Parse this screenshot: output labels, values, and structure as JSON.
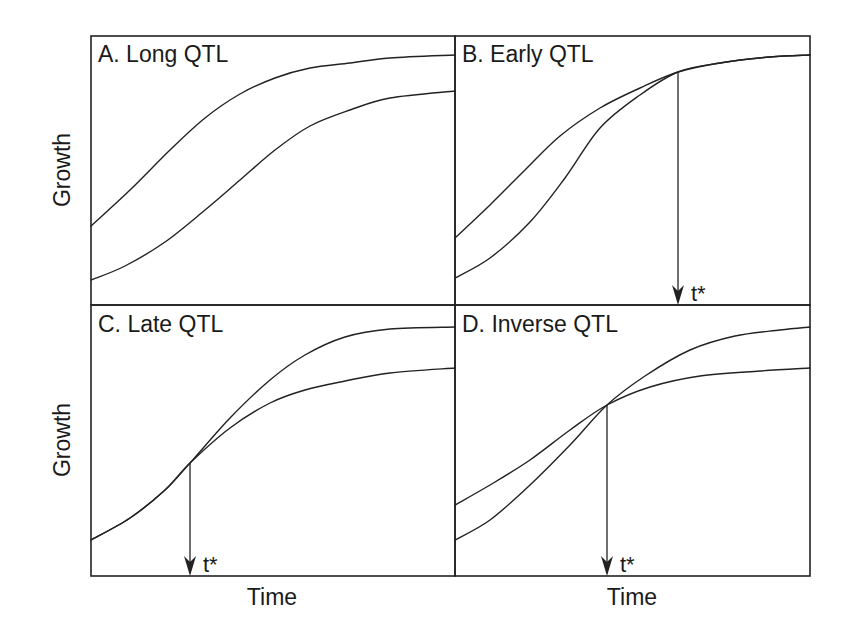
{
  "figure": {
    "y_axis_label_top": "Growth",
    "y_axis_label_bottom": "Growth",
    "x_axis_label_left": "Time",
    "x_axis_label_right": "Time",
    "line_color": "#222222",
    "background": "#ffffff"
  },
  "panels": [
    {
      "id": "A",
      "title": "A. Long QTL",
      "description": "Two growth curves separated throughout time, never crossing",
      "curves": {
        "upper": [
          [
            91,
            226
          ],
          [
            130,
            190
          ],
          [
            170,
            150
          ],
          [
            205,
            118
          ],
          [
            240,
            94
          ],
          [
            275,
            78
          ],
          [
            310,
            68
          ],
          [
            350,
            63
          ],
          [
            390,
            58
          ],
          [
            455,
            55
          ]
        ],
        "lower": [
          [
            91,
            280
          ],
          [
            125,
            266
          ],
          [
            165,
            242
          ],
          [
            205,
            210
          ],
          [
            240,
            180
          ],
          [
            275,
            150
          ],
          [
            310,
            126
          ],
          [
            350,
            110
          ],
          [
            390,
            98
          ],
          [
            455,
            91
          ]
        ]
      },
      "marker": null
    },
    {
      "id": "B",
      "title": "B. Early QTL",
      "description": "Curves differ early and converge at t*",
      "curves": {
        "upper": [
          [
            455,
            238
          ],
          [
            490,
            205
          ],
          [
            525,
            170
          ],
          [
            560,
            136
          ],
          [
            600,
            108
          ],
          [
            640,
            88
          ],
          [
            678,
            72
          ],
          [
            720,
            63
          ],
          [
            770,
            57
          ],
          [
            810,
            55
          ]
        ],
        "lower": [
          [
            455,
            278
          ],
          [
            490,
            258
          ],
          [
            530,
            222
          ],
          [
            565,
            178
          ],
          [
            600,
            128
          ],
          [
            640,
            95
          ],
          [
            678,
            72
          ],
          [
            720,
            63
          ],
          [
            770,
            57
          ],
          [
            810,
            55
          ]
        ]
      },
      "marker": {
        "label": "t*",
        "x": 678,
        "y_from": 72,
        "y_to": 305
      }
    },
    {
      "id": "C",
      "title": "C. Late QTL",
      "description": "Curves identical until t*, then diverge",
      "curves": {
        "upper": [
          [
            91,
            540
          ],
          [
            130,
            518
          ],
          [
            165,
            490
          ],
          [
            190,
            463
          ],
          [
            230,
            418
          ],
          [
            270,
            380
          ],
          [
            305,
            355
          ],
          [
            345,
            337
          ],
          [
            390,
            329
          ],
          [
            455,
            327
          ]
        ],
        "lower": [
          [
            91,
            540
          ],
          [
            130,
            518
          ],
          [
            165,
            490
          ],
          [
            190,
            463
          ],
          [
            230,
            428
          ],
          [
            270,
            403
          ],
          [
            305,
            390
          ],
          [
            345,
            381
          ],
          [
            390,
            373
          ],
          [
            455,
            368
          ]
        ]
      },
      "marker": {
        "label": "t*",
        "x": 190,
        "y_from": 463,
        "y_to": 576
      }
    },
    {
      "id": "D",
      "title": "D. Inverse QTL",
      "description": "Curves cross at t*, ranking reverses",
      "curves": {
        "upper": [
          [
            455,
            540
          ],
          [
            490,
            520
          ],
          [
            530,
            485
          ],
          [
            570,
            445
          ],
          [
            607,
            405
          ],
          [
            645,
            376
          ],
          [
            690,
            350
          ],
          [
            735,
            336
          ],
          [
            780,
            330
          ],
          [
            810,
            327
          ]
        ],
        "lower": [
          [
            455,
            505
          ],
          [
            490,
            485
          ],
          [
            530,
            460
          ],
          [
            570,
            430
          ],
          [
            607,
            405
          ],
          [
            650,
            387
          ],
          [
            700,
            376
          ],
          [
            760,
            371
          ],
          [
            810,
            368
          ]
        ]
      },
      "marker": {
        "label": "t*",
        "x": 607,
        "y_from": 405,
        "y_to": 576
      }
    }
  ]
}
